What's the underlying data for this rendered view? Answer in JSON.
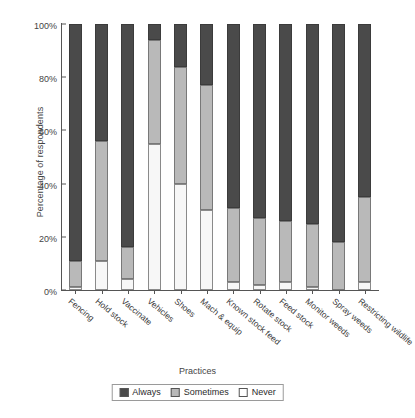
{
  "chart_data": {
    "type": "bar",
    "subtype": "stacked-100-percent",
    "title": "",
    "xlabel": "Practices",
    "ylabel": "Percentage of respondents",
    "ylim": [
      0,
      100
    ],
    "yticks": [
      "0%",
      "20%",
      "40%",
      "60%",
      "80%",
      "100%"
    ],
    "ytick_values": [
      0,
      20,
      40,
      60,
      80,
      100
    ],
    "grid": false,
    "legend_position": "bottom",
    "categories": [
      "Fencing",
      "Hold stock",
      "Vaccinate",
      "Vehicles",
      "Shoes",
      "Mach & equip",
      "Known stock feed",
      "Rotate stock",
      "Feed stock",
      "Monitor weeds",
      "Spray weeds",
      "Restricting wildlife"
    ],
    "series": [
      {
        "name": "Never",
        "color": "#f7f7f7",
        "values": [
          1,
          11,
          4,
          55,
          40,
          30,
          3,
          2,
          3,
          1,
          0,
          3
        ]
      },
      {
        "name": "Sometimes",
        "color": "#b9b9b9",
        "values": [
          10,
          45,
          12,
          39,
          44,
          47,
          28,
          25,
          23,
          24,
          18,
          32
        ]
      },
      {
        "name": "Always",
        "color": "#4a4a4a",
        "values": [
          89,
          44,
          84,
          6,
          16,
          23,
          69,
          73,
          74,
          75,
          82,
          65
        ]
      }
    ],
    "cumulative_tops": {
      "never": [
        1,
        11,
        4,
        55,
        40,
        30,
        3,
        2,
        3,
        1,
        0,
        3
      ],
      "sometimes": [
        11,
        56,
        16,
        94,
        84,
        77,
        31,
        27,
        26,
        25,
        18,
        35
      ],
      "always": [
        100,
        100,
        100,
        100,
        100,
        100,
        100,
        100,
        100,
        100,
        100,
        100
      ]
    },
    "legend": [
      {
        "label": "Always",
        "color": "#4a4a4a"
      },
      {
        "label": "Sometimes",
        "color": "#b9b9b9"
      },
      {
        "label": "Never",
        "color": "#ffffff"
      }
    ]
  }
}
